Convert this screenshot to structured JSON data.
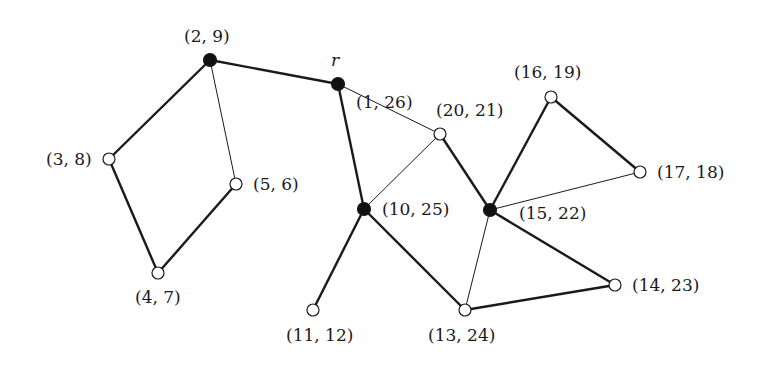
{
  "diagram": {
    "type": "graph",
    "root_label": "r",
    "colors": {
      "ink": "#1a1a1a",
      "filled": "#111111",
      "open_fill": "#ffffff"
    },
    "nodes": [
      {
        "id": "n2_9",
        "label": "(2, 9)",
        "x": 210,
        "y": 60,
        "filled": true,
        "lx": 184,
        "ly": 28
      },
      {
        "id": "n1_26",
        "label": "(1, 26)",
        "x": 338,
        "y": 84,
        "filled": true,
        "lx": 356,
        "ly": 94
      },
      {
        "id": "n3_8",
        "label": "(3, 8)",
        "x": 109,
        "y": 159,
        "filled": false,
        "lx": 46,
        "ly": 151
      },
      {
        "id": "n5_6",
        "label": "(5, 6)",
        "x": 236,
        "y": 184,
        "filled": false,
        "lx": 253,
        "ly": 176
      },
      {
        "id": "n4_7",
        "label": "(4, 7)",
        "x": 158,
        "y": 273,
        "filled": false,
        "lx": 135,
        "ly": 289
      },
      {
        "id": "n20_21",
        "label": "(20, 21)",
        "x": 440,
        "y": 134,
        "filled": false,
        "lx": 436,
        "ly": 102
      },
      {
        "id": "n10_25",
        "label": "(10, 25)",
        "x": 364,
        "y": 209,
        "filled": true,
        "lx": 382,
        "ly": 201
      },
      {
        "id": "n15_22",
        "label": "(15, 22)",
        "x": 490,
        "y": 210,
        "filled": true,
        "lx": 519,
        "ly": 205
      },
      {
        "id": "n16_19",
        "label": "(16, 19)",
        "x": 551,
        "y": 97,
        "filled": false,
        "lx": 514,
        "ly": 64
      },
      {
        "id": "n17_18",
        "label": "(17, 18)",
        "x": 640,
        "y": 172,
        "filled": false,
        "lx": 657,
        "ly": 164
      },
      {
        "id": "n14_23",
        "label": "(14, 23)",
        "x": 615,
        "y": 285,
        "filled": false,
        "lx": 632,
        "ly": 277
      },
      {
        "id": "n13_24",
        "label": "(13, 24)",
        "x": 465,
        "y": 310,
        "filled": false,
        "lx": 428,
        "ly": 327
      },
      {
        "id": "n11_12",
        "label": "(11, 12)",
        "x": 313,
        "y": 310,
        "filled": false,
        "lx": 286,
        "ly": 327
      }
    ],
    "edges": [
      {
        "from": "n2_9",
        "to": "n1_26",
        "tree": true
      },
      {
        "from": "n2_9",
        "to": "n3_8",
        "tree": true
      },
      {
        "from": "n2_9",
        "to": "n5_6",
        "tree": false
      },
      {
        "from": "n3_8",
        "to": "n4_7",
        "tree": true
      },
      {
        "from": "n4_7",
        "to": "n5_6",
        "tree": true
      },
      {
        "from": "n1_26",
        "to": "n10_25",
        "tree": true
      },
      {
        "from": "n1_26",
        "to": "n20_21",
        "tree": false
      },
      {
        "from": "n20_21",
        "to": "n10_25",
        "tree": false
      },
      {
        "from": "n20_21",
        "to": "n15_22",
        "tree": true
      },
      {
        "from": "n10_25",
        "to": "n11_12",
        "tree": true
      },
      {
        "from": "n10_25",
        "to": "n13_24",
        "tree": true
      },
      {
        "from": "n13_24",
        "to": "n14_23",
        "tree": true
      },
      {
        "from": "n15_22",
        "to": "n14_23",
        "tree": true
      },
      {
        "from": "n15_22",
        "to": "n13_24",
        "tree": false
      },
      {
        "from": "n15_22",
        "to": "n16_19",
        "tree": true
      },
      {
        "from": "n16_19",
        "to": "n17_18",
        "tree": true
      },
      {
        "from": "n15_22",
        "to": "n17_18",
        "tree": false
      }
    ]
  }
}
